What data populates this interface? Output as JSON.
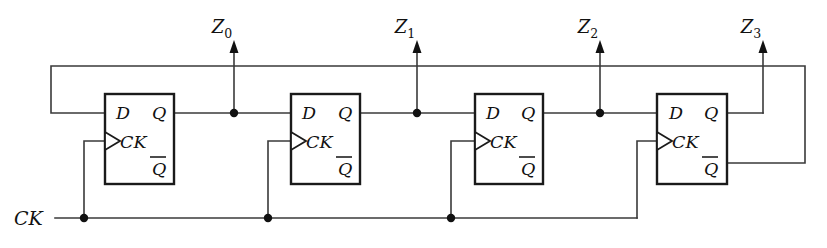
{
  "diagram": {
    "colors": {
      "wire": "#3a3a3a",
      "box_outline": "#1a1a1a",
      "text": "#111111",
      "background": "#ffffff"
    },
    "clock_input": {
      "label": "CK"
    },
    "outputs": [
      {
        "label": "Z",
        "subscript": "0"
      },
      {
        "label": "Z",
        "subscript": "1"
      },
      {
        "label": "Z",
        "subscript": "2"
      },
      {
        "label": "Z",
        "subscript": "3"
      }
    ],
    "flipflops": [
      {
        "name": "flipflop-1",
        "d_label": "D",
        "ck_label": "CK",
        "q_label": "Q",
        "qbar_label": "Q"
      },
      {
        "name": "flipflop-2",
        "d_label": "D",
        "ck_label": "CK",
        "q_label": "Q",
        "qbar_label": "Q"
      },
      {
        "name": "flipflop-3",
        "d_label": "D",
        "ck_label": "CK",
        "q_label": "Q",
        "qbar_label": "Q"
      },
      {
        "name": "flipflop-4",
        "d_label": "D",
        "ck_label": "CK",
        "q_label": "Q",
        "qbar_label": "Q"
      }
    ]
  }
}
